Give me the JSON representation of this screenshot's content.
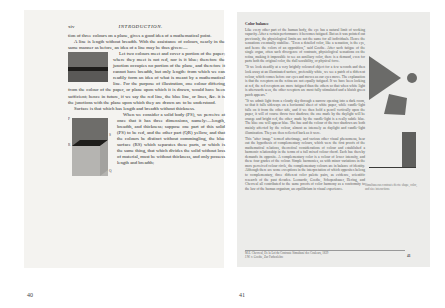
{
  "spread": {
    "left_page": {
      "folio": "xiv",
      "running_head": "INTRODUCTION.",
      "paragraphs": [
        "tion of three colours on a plane, gives a good idea of a mathematical point.",
        "A line is length without breadth. With the assistance of colours, nearly in the same manner as before, an idea of a line may be thus given:—",
        "Let two colours meet and cover a portion of the paper; where they meet is not red, nor is it blue; therefore the junction occupies no portion of the plane, and therefore it cannot have breadth, but only length: from which we can readily form an idea of what is meant by a mathematical line. For the purpose of illustration, one colour differing from the colour of the paper, or plane upon which it is drawn, would have been sufficient; hence in future, if we say the red line, the blue line, or lines, &c. it is the junctions with the plane upon which they are drawn are to be understood.",
        "Surface is that which has length and breadth without thickness.",
        "When we consider a solid body (PS), we perceive at once that it has three dimensions, namely:—length, breadth, and thickness; suppose one part of this solid (PS) to be red, and the other part (QR) yellow, and that the colours be distinct without commingling, the blue surface (RS) which separates these parts, or which is the same thing, that which divides the solid without loss of material, must be without thickness, and only possess length and breadth;"
      ],
      "figure_labels": [
        "P",
        "R",
        "S",
        "Q"
      ],
      "page_number": "40"
    },
    "right_page": {
      "section_title": "Color balance",
      "paragraphs": [
        "Like every other part of the human body, the eye has a natural limit of working capacity. After a certain performance it becomes fatigued. But as it was pointed out previously, the physiological limits are not the same for all individuals. Hence the sensations eventually stabilize. \"Even a detailed color, like a sensation, is the eye, and hence the colors of an opposition,\" said Goethe. After such fatigue of the single organ, often such divergence of contrasts, physiological sensations on the retina, making it impossible to see an auxiliary color, there is a demand, even for parts both the original color, the dull sensibility, or physical force.",
        "\"If we look steadily at a very brightly coloured object for a few seconds and then look away at an illuminated surface, preferably white, we see a patch of a different colour, which comes before our eyes and moves as our eyes move. The explanation is that the receptors on the retina are not equally fatigued. If we have been looking at red, the red receptors are more fatigued than the others so that when white light is afterwards seen, the other receptors are most fully stimulated and a bluish green patch appears.\"",
        "\"If we admit light from a cloudy sky through a narrow opening into a dark room, so that it falls sideways on a horizontal sheet of white paper, while candle-light falls on it from the other side, and if we then hold a pencil vertically upon the paper, it will of course throw two shadows; the one made by the daylight will be orange and bright red, the other, made by the candle-light is a really subtle blue. The blue one will appear blue. The hue and the colour of the two shadows are both mainly affected by the colour, almost as intensely as daylight and candle-light illumination. They are then reflected back as it were.",
        "This \"after image\" termed afterimage, and various other visual phenomena, bear out the hypothesis of complementary colours, which were the first proofs of the mathematical relations, theoretical considerations of colour and established a harmonic relationship in the terms of a full mixed colour chord. Each hue thereby demands its opposite. A complementary color is a colour of lower intensity, and these four grades of the colour. Simple harmonies, as with minor variations in the more perceived colour circle, the complementary colours are in balance of identity. Although there are some exceptions in the interpretation of which opposites belong to complementary, three different color palette pairs, as evidence, scientific research of the past decades. Leonardo, Goethe, Schopenhauer, Hering, and Chevreul all contributed to the same proofs of color harmony as a conformity to the law of the human organism, an equilibrium in visual experience."
      ],
      "figure_caption": "Simultaneous contrast effects: shape, color, and size interactions",
      "footnote_lines": [
        "M.E. Chevreul, De la Loi du Contraste Simultané des Couleurs, 1839",
        "J.W. v. Goethe, Zur Farbenlehre"
      ],
      "folio": "41",
      "page_number": "41"
    }
  },
  "colors": {
    "left_paper": "#f4f3f0",
    "right_paper": "#ececea",
    "figure_dark": "#1e1d1b",
    "figure_mid": "#6e6d6a",
    "figure_light": "#b5b4b1",
    "shape_gray": "#6b6b69"
  }
}
